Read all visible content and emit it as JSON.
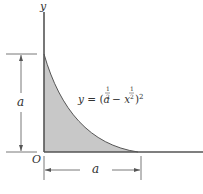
{
  "diagram": {
    "axis_labels": {
      "y": "y",
      "origin": "O"
    },
    "dimensions": {
      "height_label": "a",
      "width_label": "a"
    },
    "equation": {
      "prefix": "y = (a",
      "exp1": "1/2",
      "minus": " − x",
      "exp2": "1/2",
      "suffix": ")",
      "outer_exp": "2"
    },
    "colors": {
      "fill": "#c8c8c8",
      "stroke": "#555555",
      "text": "#333333"
    }
  }
}
